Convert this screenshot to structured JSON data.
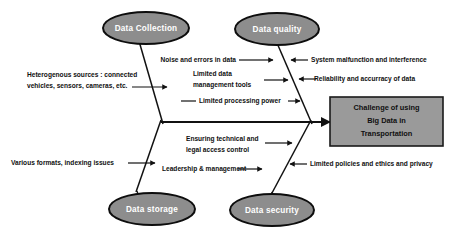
{
  "diagram": {
    "type": "fishbone-ishikawa",
    "effect": {
      "lines": [
        "Challenge of using",
        "Big Data in",
        "Transportation"
      ],
      "box_fill": "#9a9a9a",
      "box_stroke": "#1a1a1a"
    },
    "category_fill": "#8d8d8d",
    "category_stroke": "#0d0d0d",
    "categories": [
      {
        "id": "data-collection",
        "label": "Data Collection",
        "position": "top-left",
        "causes": [
          {
            "id": "heterogenous-sources",
            "lines": [
              "Heterogenous sources : connected",
              "vehicles, sensors, cameras, etc."
            ],
            "side": "left"
          },
          {
            "id": "noise-errors",
            "lines": [
              "Noise and errors in data"
            ],
            "side": "right"
          }
        ]
      },
      {
        "id": "data-quality",
        "label": "Data quality",
        "position": "top-right",
        "causes": [
          {
            "id": "limited-data-management-tools",
            "lines": [
              "Limited data",
              "management tools"
            ],
            "side": "left"
          },
          {
            "id": "limited-processing-power",
            "lines": [
              "Limited processing power"
            ],
            "side": "left"
          },
          {
            "id": "system-malfunction",
            "lines": [
              "System malfunction and interference"
            ],
            "side": "right"
          },
          {
            "id": "reliability-accuracy",
            "lines": [
              "Reliability and accurracy of data"
            ],
            "side": "right"
          }
        ]
      },
      {
        "id": "data-storage",
        "label": "Data storage",
        "position": "bottom-left",
        "causes": [
          {
            "id": "various-formats",
            "lines": [
              "Various formats, indexing issues"
            ],
            "side": "left"
          },
          {
            "id": "leadership-management",
            "lines": [
              "Leadership & management"
            ],
            "side": "right"
          }
        ]
      },
      {
        "id": "data-security",
        "label": "Data security",
        "position": "bottom-right",
        "causes": [
          {
            "id": "ensuring-technical-legal",
            "lines": [
              "Ensuring technical and",
              "legal access control"
            ],
            "side": "left"
          },
          {
            "id": "limited-policies",
            "lines": [
              "Limited policies and ethics and privacy"
            ],
            "side": "right"
          }
        ]
      }
    ]
  }
}
